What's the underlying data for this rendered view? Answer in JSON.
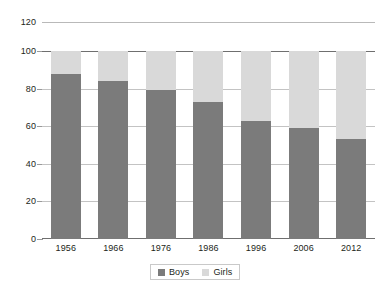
{
  "chart_data": {
    "type": "bar",
    "stacked": true,
    "title": "",
    "subtitle": "",
    "xlabel": "",
    "ylabel": "",
    "categories": [
      "1956",
      "1966",
      "1976",
      "1986",
      "1996",
      "2006",
      "2012"
    ],
    "series": [
      {
        "name": "Boys",
        "color": "#7b7b7b",
        "values": [
          88,
          84,
          79,
          73,
          63,
          59,
          53
        ]
      },
      {
        "name": "Girls",
        "color": "#d9d9d9",
        "values": [
          12,
          16,
          21,
          27,
          37,
          41,
          47
        ]
      }
    ],
    "ylim": [
      0,
      120
    ],
    "yticks": [
      "0",
      "20",
      "40",
      "60",
      "80",
      "100",
      "120"
    ],
    "grid": true,
    "legend_position": "bottom"
  },
  "axis": {
    "top_reference_label": "120",
    "y_tick_labels": [
      "100",
      "80",
      "60",
      "40",
      "20",
      "0"
    ]
  },
  "xaxis": {
    "labels": [
      "1956",
      "1966",
      "1976",
      "1986",
      "1996",
      "2006",
      "2012"
    ]
  },
  "legend": {
    "items": [
      {
        "label": "Boys",
        "swatch": "boys-swatch-icon"
      },
      {
        "label": "Girls",
        "swatch": "girls-swatch-icon"
      }
    ]
  },
  "colors": {
    "boys": "#7b7b7b",
    "girls": "#d9d9d9",
    "grid": "#c3c3c3",
    "axis": "#6f6f6f",
    "text": "#231f20"
  }
}
